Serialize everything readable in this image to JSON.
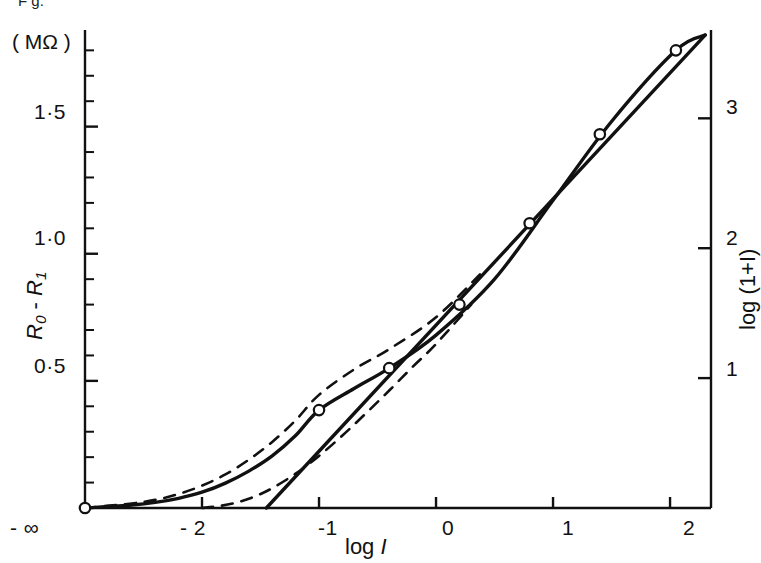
{
  "figure": {
    "top_fragment": "F  g.",
    "left_axis": {
      "unit_label": "( MΩ )",
      "title_parts": {
        "r0": "R",
        "r0_sub": "0",
        "minus": " - ",
        "r1": "R",
        "r1_sub": "1"
      },
      "tick_labels": [
        "0·5",
        "1·0",
        "1·5"
      ]
    },
    "right_axis": {
      "title": "log (1+I)",
      "tick_labels": [
        "1",
        "2",
        "3"
      ]
    },
    "bottom_axis": {
      "title_prefix": "log ",
      "title_var": "I",
      "tick_labels": [
        "- ∞",
        "- 2",
        "-1",
        "0",
        "1",
        "2"
      ]
    },
    "colors": {
      "ink": "#111111",
      "background": "#ffffff"
    }
  },
  "chart_data": {
    "type": "line",
    "title": "",
    "xlabel": "log I",
    "ylabel": "R0 - R1  (MΩ)",
    "y2label": "log (1+I)",
    "xlim": [
      -3.0,
      2.35
    ],
    "ylim": [
      0,
      1.88
    ],
    "y2lim": [
      0,
      3.68
    ],
    "grid": false,
    "legend": "none",
    "xticks": [
      -3.0,
      -2.0,
      -1.0,
      0.0,
      1.0,
      2.0
    ],
    "xticklabels": [
      "- ∞",
      "- 2",
      "-1",
      "0",
      "1",
      "2"
    ],
    "yticks": [
      0.5,
      1.0,
      1.5
    ],
    "yticklabels": [
      "0·5",
      "1·0",
      "1·5"
    ],
    "yminor_step": 0.1,
    "y2ticks": [
      1,
      2,
      3
    ],
    "y2ticklabels": [
      "1",
      "2",
      "3"
    ],
    "series": [
      {
        "name": "measured points",
        "style": "open-circle-markers",
        "x": [
          -3.0,
          -1.0,
          -0.4,
          0.2,
          0.8,
          1.4,
          2.05
        ],
        "y": [
          0.0,
          0.385,
          0.55,
          0.8,
          1.12,
          1.47,
          1.8
        ]
      },
      {
        "name": "experimental curve",
        "style": "solid",
        "x": [
          -3.0,
          -2.6,
          -2.4,
          -2.2,
          -2.0,
          -1.8,
          -1.6,
          -1.4,
          -1.2,
          -1.0,
          -0.7,
          -0.4,
          0.0,
          0.5,
          1.0,
          1.5,
          2.05,
          2.3
        ],
        "y": [
          0.0,
          0.012,
          0.022,
          0.038,
          0.062,
          0.098,
          0.145,
          0.205,
          0.285,
          0.385,
          0.47,
          0.55,
          0.68,
          0.9,
          1.21,
          1.52,
          1.8,
          1.86
        ]
      },
      {
        "name": "theoretical upper (dashed)",
        "style": "dashed",
        "x": [
          -3.0,
          -2.6,
          -2.4,
          -2.2,
          -2.0,
          -1.8,
          -1.6,
          -1.4,
          -1.2,
          -1.0,
          -0.7,
          -0.4,
          0.0,
          0.4
        ],
        "y": [
          0.0,
          0.018,
          0.032,
          0.055,
          0.088,
          0.132,
          0.19,
          0.26,
          0.345,
          0.445,
          0.545,
          0.625,
          0.75,
          0.93
        ]
      },
      {
        "name": "theoretical lower (dashed)",
        "style": "dashed",
        "x": [
          -2.0,
          -1.85,
          -1.7,
          -1.55,
          -1.4,
          -1.2,
          -1.0,
          -0.8,
          -0.6,
          -0.4,
          -0.2,
          0.0,
          0.3
        ],
        "y": [
          0.0,
          0.008,
          0.022,
          0.045,
          0.078,
          0.135,
          0.205,
          0.285,
          0.372,
          0.462,
          0.555,
          0.645,
          0.8
        ]
      },
      {
        "name": "linear asymptote",
        "style": "solid-straight",
        "x": [
          -1.45,
          2.3
        ],
        "y": [
          0.0,
          1.86
        ]
      }
    ]
  }
}
